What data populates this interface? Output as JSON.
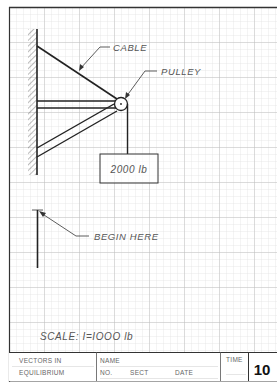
{
  "drawing": {
    "labels": {
      "cable": "CABLE",
      "pulley": "PULLEY",
      "load": "2000 lb",
      "begin": "BEGIN HERE",
      "scale": "SCALE: I=IOOO lb"
    },
    "grid": {
      "cell_px": 7,
      "major_every": 5,
      "minor_color": "#d6d6d6",
      "major_color": "#b4b4b4"
    },
    "line_color": "#222222"
  },
  "title_block": {
    "title_line1": "VECTORS IN",
    "title_line2": "EQUILIBRIUM",
    "name_label": "NAME",
    "no_label": "NO.",
    "sect_label": "SECT",
    "date_label": "DATE",
    "time_label": "TIME",
    "sheet_number": "10"
  }
}
